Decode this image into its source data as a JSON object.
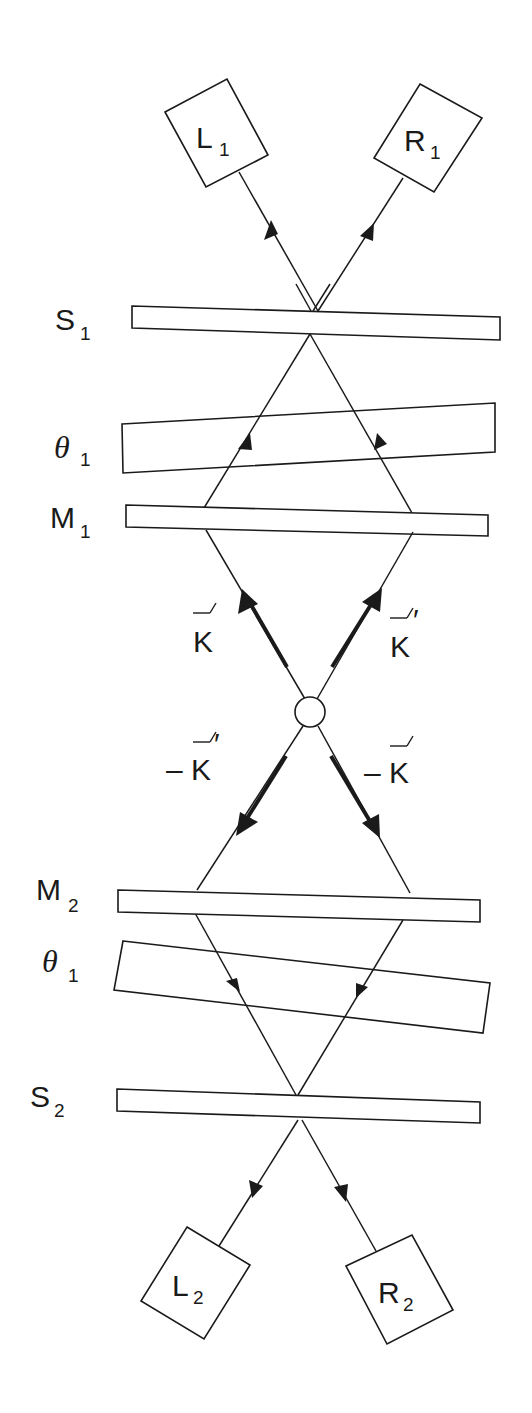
{
  "diagram": {
    "detectors": {
      "L1": {
        "main": "L",
        "sub": "1"
      },
      "R1": {
        "main": "R",
        "sub": "1"
      },
      "L2": {
        "main": "L",
        "sub": "2"
      },
      "R2": {
        "main": "R",
        "sub": "2"
      }
    },
    "plates": {
      "S1": {
        "main": "S",
        "sub": "1"
      },
      "theta_top": {
        "main": "θ",
        "sub": "1"
      },
      "M1": {
        "main": "M",
        "sub": "1"
      },
      "M2": {
        "main": "M",
        "sub": "2"
      },
      "theta_bottom": {
        "main": "θ",
        "sub": "1"
      },
      "S2": {
        "main": "S",
        "sub": "2"
      }
    },
    "vectors": {
      "k": {
        "prefix": "",
        "main": "K",
        "prime": ""
      },
      "k_prime": {
        "prefix": "",
        "main": "K",
        "prime": "′"
      },
      "neg_k_prime": {
        "prefix": "–",
        "main": "K",
        "prime": "′"
      },
      "neg_k": {
        "prefix": "–",
        "main": "K",
        "prime": ""
      }
    },
    "source": "source-circle",
    "colors": {
      "ink": "#1a1a1a",
      "background": "#ffffff"
    }
  }
}
